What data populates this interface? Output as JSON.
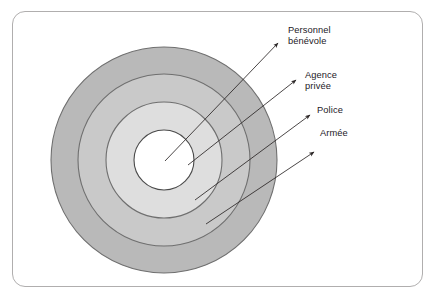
{
  "figure": {
    "kind": "concentric-ring-diagram",
    "frame": {
      "border_color": "#b0aeae",
      "background": "#ffffff",
      "corner_radius": 13
    },
    "center": {
      "x": 164,
      "y": 160
    },
    "rings": [
      {
        "id": "armee",
        "label": "Armée",
        "order": 1,
        "position": "outermost",
        "radius": 113,
        "fill": "#b9b9b9",
        "stroke": "#6f6f6f"
      },
      {
        "id": "police",
        "label": "Police",
        "order": 2,
        "position": "second",
        "radius": 86,
        "fill": "#c9c9c9",
        "stroke": "#6f6f6f"
      },
      {
        "id": "agence-privee",
        "label": "Agence privée",
        "order": 3,
        "position": "third",
        "radius": 58,
        "fill": "#dedede",
        "stroke": "#6f6f6f"
      },
      {
        "id": "personnel-benevole",
        "label": "Personnel bénévole",
        "order": 4,
        "position": "innermost",
        "radius": 30,
        "fill": "#ffffff",
        "stroke": "#4a4a4a"
      }
    ],
    "labels": [
      {
        "id": "personnel",
        "lines": [
          "Personnel",
          "bénévole"
        ],
        "text": "Personnel bénévole",
        "color": "#24201f"
      },
      {
        "id": "agence",
        "lines": [
          "Agence",
          "privée"
        ],
        "text": "Agence privée",
        "color": "#24201f"
      },
      {
        "id": "police",
        "lines": [
          "Police"
        ],
        "text": "Police",
        "color": "#24201f"
      },
      {
        "id": "armee",
        "lines": [
          "Armée"
        ],
        "text": "Armée",
        "color": "#24201f"
      }
    ],
    "arrows": [
      {
        "id": "arrow-personnel",
        "from": {
          "x": 165,
          "y": 161
        },
        "to": {
          "x": 278,
          "y": 43
        },
        "color": "#2b2626"
      },
      {
        "id": "arrow-agence",
        "from": {
          "x": 188,
          "y": 165
        },
        "to": {
          "x": 296,
          "y": 80
        },
        "color": "#2b2626"
      },
      {
        "id": "arrow-police",
        "from": {
          "x": 195,
          "y": 200
        },
        "to": {
          "x": 310,
          "y": 115
        },
        "color": "#2b2626"
      },
      {
        "id": "arrow-armee",
        "from": {
          "x": 206,
          "y": 224
        },
        "to": {
          "x": 314,
          "y": 152
        },
        "color": "#2b2626"
      }
    ]
  }
}
